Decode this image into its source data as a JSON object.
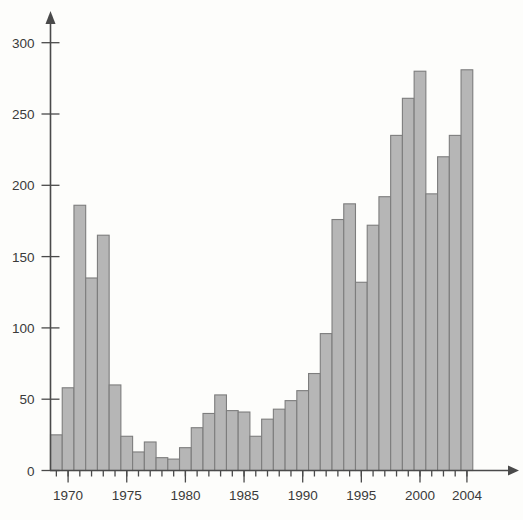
{
  "chart_data": {
    "type": "bar",
    "title": "",
    "subtitle": "",
    "xlabel": "",
    "ylabel": "",
    "categories": [
      1969,
      1970,
      1971,
      1972,
      1973,
      1974,
      1975,
      1976,
      1977,
      1978,
      1979,
      1980,
      1981,
      1982,
      1983,
      1984,
      1985,
      1986,
      1987,
      1988,
      1989,
      1990,
      1991,
      1992,
      1993,
      1994,
      1995,
      1996,
      1997,
      1998,
      1999,
      2000,
      2001,
      2002,
      2003,
      2004
    ],
    "values": [
      25,
      58,
      186,
      135,
      165,
      60,
      24,
      13,
      20,
      9,
      8,
      16,
      30,
      40,
      53,
      42,
      41,
      24,
      36,
      43,
      49,
      56,
      68,
      96,
      176,
      187,
      132,
      172,
      192,
      235,
      261,
      280,
      194,
      220,
      235,
      281
    ],
    "xtick_labels": [
      "1970",
      "1975",
      "1980",
      "1985",
      "1990",
      "1995",
      "2000",
      "2004"
    ],
    "xtick_values": [
      1970,
      1975,
      1980,
      1985,
      1990,
      1995,
      2000,
      2004
    ],
    "ytick_labels": [
      "0",
      "50",
      "100",
      "150",
      "200",
      "250",
      "300"
    ],
    "ytick_values": [
      0,
      50,
      100,
      150,
      200,
      250,
      300
    ],
    "xlim": [
      1968.5,
      2005.5
    ],
    "ylim": [
      0,
      310
    ],
    "grid": false,
    "legend": null,
    "colors": {
      "bar_fill": "#b6b6b6",
      "bar_stroke": "#7d7d7d",
      "axis": "#4a4a4a",
      "text": "#3a3a3a",
      "background": "#fdfdfb"
    }
  }
}
